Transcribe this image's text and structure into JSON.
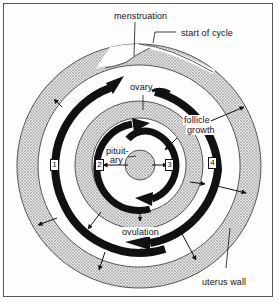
{
  "diagram": {
    "labels": {
      "menstruation": "menstruation",
      "start_of_cycle": "start of cycle",
      "ovary": "ovary",
      "follicle": "follicle",
      "growth": "growth",
      "pituitary_1": "pituit-",
      "pituitary_2": "ary",
      "ovulation": "ovulation",
      "uterus_wall": "uterus wall"
    },
    "stages": [
      "1",
      "2",
      "3",
      "4"
    ],
    "colors": {
      "ink": "#111111",
      "stipple": "#bdbdbd",
      "background": "#ffffff"
    }
  }
}
